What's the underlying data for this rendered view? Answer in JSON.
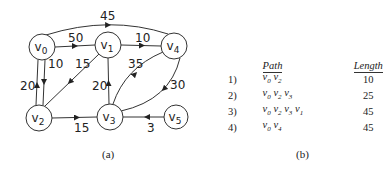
{
  "graph": {
    "nodes": [
      {
        "id": "v0",
        "label": "v",
        "sub": "0",
        "x": 42,
        "y": 47
      },
      {
        "id": "v1",
        "label": "v",
        "sub": "1",
        "x": 108,
        "y": 45
      },
      {
        "id": "v4",
        "label": "v",
        "sub": "4",
        "x": 174,
        "y": 46
      },
      {
        "id": "v2",
        "label": "v",
        "sub": "2",
        "x": 39,
        "y": 118
      },
      {
        "id": "v3",
        "label": "v",
        "sub": "3",
        "x": 110,
        "y": 117
      },
      {
        "id": "v5",
        "label": "v",
        "sub": "5",
        "x": 176,
        "y": 117
      }
    ],
    "edges": [
      {
        "from": "v0",
        "to": "v4",
        "weight": "45"
      },
      {
        "from": "v0",
        "to": "v1",
        "weight": "50"
      },
      {
        "from": "v1",
        "to": "v4",
        "weight": "10"
      },
      {
        "from": "v0",
        "to": "v2",
        "weight": "10"
      },
      {
        "from": "v2",
        "to": "v0",
        "weight": "20"
      },
      {
        "from": "v1",
        "to": "v2",
        "weight": "15"
      },
      {
        "from": "v3",
        "to": "v1",
        "weight": "20"
      },
      {
        "from": "v3",
        "to": "v4",
        "weight": "35"
      },
      {
        "from": "v4",
        "to": "v3",
        "weight": "30"
      },
      {
        "from": "v2",
        "to": "v3",
        "weight": "15"
      },
      {
        "from": "v5",
        "to": "v3",
        "weight": "3"
      }
    ],
    "caption": "(a)"
  },
  "table": {
    "headers": {
      "path": "Path",
      "length": "Length"
    },
    "rows": [
      {
        "num": "1)",
        "path": "v0 v2",
        "length": "10"
      },
      {
        "num": "2)",
        "path": "v0 v2 v3",
        "length": "25"
      },
      {
        "num": "3)",
        "path": "v0 v2 v3 v1",
        "length": "45"
      },
      {
        "num": "4)",
        "path": "v0 v4",
        "length": "45"
      }
    ],
    "caption": "(b)"
  }
}
